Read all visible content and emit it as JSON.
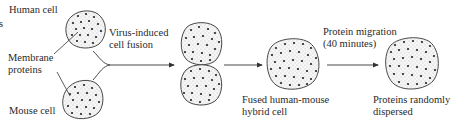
{
  "diagram": {
    "type": "cell-fusion-experiment",
    "edge_fragment": "s",
    "labels": {
      "human_cell": "Human cell",
      "membrane_proteins_1": "Membrane",
      "membrane_proteins_2": "proteins",
      "mouse_cell": "Mouse cell",
      "fusion_1": "Virus-induced",
      "fusion_2": "cell fusion",
      "hybrid_1": "Fused human-mouse",
      "hybrid_2": "hybrid cell",
      "migration_1": "Protein migration",
      "migration_2": "(40 minutes)",
      "result_1": "Proteins randomly",
      "result_2": "dispersed"
    },
    "stages": [
      {
        "id": "human-cell",
        "label": "Human cell"
      },
      {
        "id": "mouse-cell",
        "label": "Mouse cell"
      },
      {
        "id": "fusing-cells",
        "label": "Virus-induced cell fusion"
      },
      {
        "id": "hybrid-cell",
        "label": "Fused human-mouse hybrid cell"
      },
      {
        "id": "dispersed-cell",
        "label": "Proteins randomly dispersed"
      }
    ],
    "arrows": [
      {
        "from": "human-cell+mouse-cell",
        "to": "fusing-cells",
        "label": "Virus-induced cell fusion"
      },
      {
        "from": "fusing-cells",
        "to": "hybrid-cell",
        "label": ""
      },
      {
        "from": "hybrid-cell",
        "to": "dispersed-cell",
        "label": "Protein migration (40 minutes)"
      }
    ],
    "colors": {
      "ink": "#222222",
      "cell_fill": "#f4f4f4",
      "stipple": "#9a9a9a"
    }
  }
}
